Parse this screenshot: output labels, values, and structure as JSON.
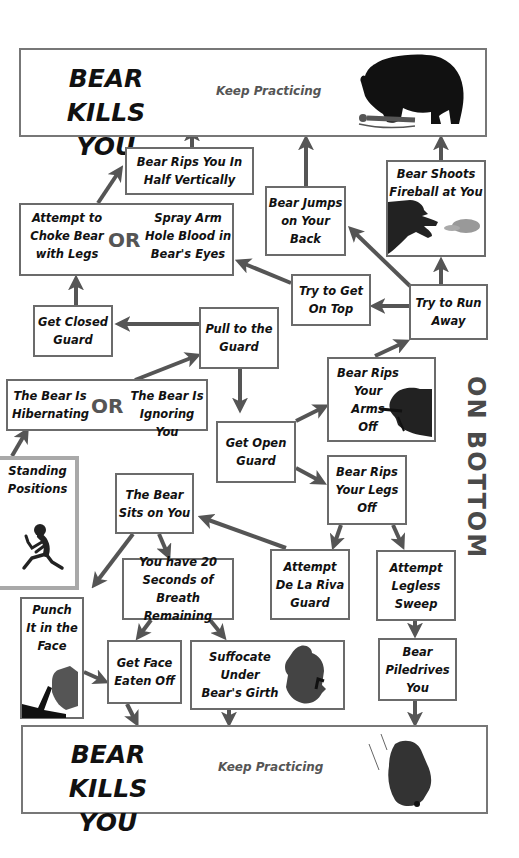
{
  "colors": {
    "box_border": "#6b6b6b",
    "standing_border": "#a9a9a9",
    "arrow": "#555555",
    "silhouette": "#111111",
    "subtext": "#555555",
    "side_label": "#4a4a4a"
  },
  "side_label": "ON BOTTOM",
  "top_outcome": {
    "title": "BEAR KILLS\nYOU",
    "subtitle": "Keep Practicing",
    "icon": "bear-eating-person-icon"
  },
  "bottom_outcome": {
    "title": "BEAR KILLS\nYOU",
    "subtitle": "Keep Practicing",
    "icon": "falling-bear-icon"
  },
  "or_label": "OR",
  "nodes": {
    "rips_half": "Bear Rips You In\nHalf Vertically",
    "choke_legs": "Attempt to\nChoke Bear\nwith Legs",
    "spray_blood": "Spray Arm\nHole Blood in\nBear's Eyes",
    "jumps_back": "Bear Jumps\non Your\nBack",
    "fireball": "Bear Shoots\nFireball at You",
    "get_on_top": "Try to Get\nOn Top",
    "run_away": "Try to Run\nAway",
    "closed_guard": "Get Closed\nGuard",
    "pull_guard": "Pull to the\nGuard",
    "hibernating": "The Bear Is\nHibernating",
    "ignoring": "The Bear Is\nIgnoring You",
    "rips_arms": "Bear Rips\nYour Arms\nOff",
    "open_guard": "Get Open\nGuard",
    "rips_legs": "Bear Rips\nYour Legs\nOff",
    "standing": "Standing\nPositions",
    "sits_on_you": "The Bear\nSits on You",
    "de_la_riva": "Attempt\nDe La Riva\nGuard",
    "legless_sweep": "Attempt\nLegless\nSweep",
    "twenty_seconds": "You have 20\nSeconds of\nBreath Remaining",
    "punch_face": "Punch\nIt in the\nFace",
    "face_eaten": "Get Face\nEaten Off",
    "suffocate": "Suffocate\nUnder\nBear's Girth",
    "piledrives": "Bear\nPiledrives\nYou"
  },
  "edges": [
    [
      "standing",
      "hibernating_or_ignoring"
    ],
    [
      "hibernating_or_ignoring",
      "pull_guard"
    ],
    [
      "pull_guard",
      "closed_guard"
    ],
    [
      "pull_guard",
      "open_guard"
    ],
    [
      "closed_guard",
      "choke_or_spray"
    ],
    [
      "choke_or_spray",
      "rips_half"
    ],
    [
      "rips_half",
      "top_outcome"
    ],
    [
      "get_on_top",
      "choke_or_spray"
    ],
    [
      "run_away",
      "get_on_top"
    ],
    [
      "run_away",
      "jumps_back"
    ],
    [
      "run_away",
      "fireball"
    ],
    [
      "jumps_back",
      "top_outcome"
    ],
    [
      "fireball",
      "top_outcome"
    ],
    [
      "open_guard",
      "rips_arms"
    ],
    [
      "open_guard",
      "rips_legs"
    ],
    [
      "rips_arms",
      "run_away"
    ],
    [
      "rips_legs",
      "de_la_riva"
    ],
    [
      "rips_legs",
      "legless_sweep"
    ],
    [
      "de_la_riva",
      "sits_on_you"
    ],
    [
      "sits_on_you",
      "punch_face"
    ],
    [
      "sits_on_you",
      "twenty_seconds"
    ],
    [
      "twenty_seconds",
      "face_eaten"
    ],
    [
      "twenty_seconds",
      "suffocate"
    ],
    [
      "punch_face",
      "face_eaten"
    ],
    [
      "face_eaten",
      "bottom_outcome"
    ],
    [
      "suffocate",
      "bottom_outcome"
    ],
    [
      "legless_sweep",
      "piledrives"
    ],
    [
      "piledrives",
      "bottom_outcome"
    ]
  ]
}
